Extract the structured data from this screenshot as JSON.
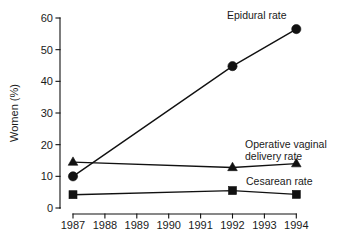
{
  "chart_data": {
    "type": "line",
    "title": "",
    "xlabel": "",
    "ylabel": "Women (%)",
    "x": [
      1987,
      1992,
      1994
    ],
    "categories": [
      "1987",
      "1988",
      "1989",
      "1990",
      "1991",
      "1992",
      "1993",
      "1994"
    ],
    "xlim": [
      1987,
      1994
    ],
    "ylim": [
      0,
      60
    ],
    "yticks": [
      0,
      10,
      20,
      30,
      40,
      50,
      60
    ],
    "ytick_labels": [
      "0",
      "10",
      "20",
      "30",
      "40",
      "50",
      "60"
    ],
    "xtick_labels": [
      "1987",
      "1988",
      "1989",
      "1990",
      "1991",
      "1992",
      "1993",
      "1994"
    ],
    "grid": false,
    "legend_position": "inline-annotations",
    "series": [
      {
        "name": "Epidural rate",
        "marker": "circle",
        "x": [
          1987,
          1992,
          1994
        ],
        "values": [
          10.0,
          44.8,
          56.5
        ]
      },
      {
        "name": "Operative vaginal delivery rate",
        "marker": "triangle",
        "x": [
          1987,
          1992,
          1994
        ],
        "values": [
          14.5,
          12.8,
          14.0
        ]
      },
      {
        "name": "Cesarean rate",
        "marker": "square",
        "x": [
          1987,
          1992,
          1994
        ],
        "values": [
          4.2,
          5.5,
          4.3
        ]
      }
    ],
    "annotations": [
      {
        "text": "Epidural rate",
        "series": "Epidural rate"
      },
      {
        "text": "Operative vaginal",
        "series": "Operative vaginal delivery rate"
      },
      {
        "text": "delivery rate",
        "series": "Operative vaginal delivery rate"
      },
      {
        "text": "Cesarean rate",
        "series": "Cesarean rate"
      }
    ],
    "colors": {
      "line": "#111111",
      "marker": "#111111",
      "axis": "#111111",
      "text": "#1a1a1a",
      "background": "#ffffff"
    }
  }
}
